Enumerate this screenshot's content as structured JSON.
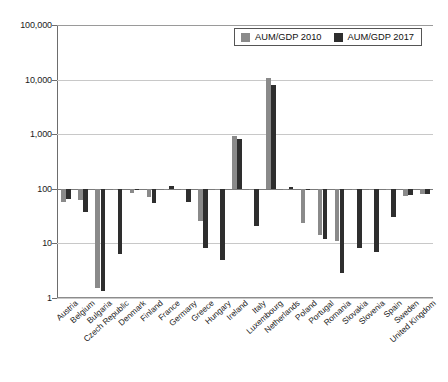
{
  "chart_data": {
    "type": "bar",
    "title": "",
    "subtitle": "",
    "xlabel": "",
    "ylabel": "",
    "scale": "log",
    "ylim": [
      1,
      100000
    ],
    "ytick_labels": [
      "100,000",
      "10,000",
      "1,000",
      "100",
      "10",
      "1"
    ],
    "ytick_values": [
      100000,
      10000,
      1000,
      100,
      10,
      1
    ],
    "grid": true,
    "legend_position": "top-right",
    "categories": [
      "Austria",
      "Belgium",
      "Bulgaria",
      "Czech Republic",
      "Denmark",
      "Finland",
      "France",
      "Germany",
      "Greece",
      "Hungary",
      "Ireland",
      "Italy",
      "Luxembourg",
      "Netherlands",
      "Poland",
      "Portugal",
      "Romania",
      "Slovakia",
      "Slovenia",
      "Spain",
      "Sweden",
      "United Kingdom"
    ],
    "series": [
      {
        "name": "AUM/GDP 2010",
        "color": "#8a8a8a",
        "values": [
          58,
          63,
          1.5,
          100,
          83,
          71,
          100,
          100,
          26,
          100,
          910,
          100,
          10500,
          100,
          24,
          14,
          11,
          100,
          100,
          100,
          75,
          80
        ]
      },
      {
        "name": "AUM/GDP 2017",
        "color": "#2e2e2e",
        "values": [
          66,
          37,
          1.35,
          6.4,
          100,
          55,
          112,
          58,
          8.2,
          5.0,
          800,
          21,
          7800,
          110,
          100,
          12,
          2.9,
          8.2,
          7.0,
          30,
          78,
          82
        ]
      }
    ],
    "legend": [
      {
        "label": "AUM/GDP 2010",
        "color": "#8a8a8a",
        "swatch": "legend-swatch-2010"
      },
      {
        "label": "AUM/GDP 2017",
        "color": "#2e2e2e",
        "swatch": "legend-swatch-2017"
      }
    ]
  },
  "colors": {
    "series_2010": "#8a8a8a",
    "series_2017": "#2e2e2e",
    "axis": "#6d6d6d",
    "grid": "#c8c8c8",
    "background": "#ffffff"
  }
}
